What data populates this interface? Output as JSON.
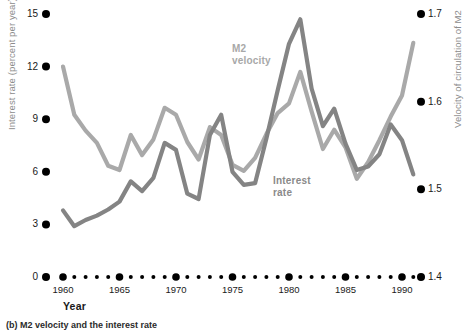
{
  "figure": {
    "caption": "(b) M2 velocity and the interest rate",
    "x_axis_title": "Year",
    "left_axis_title": "Interest rate (percent per year)",
    "right_axis_title": "Velocity of circulation of M2"
  },
  "colors": {
    "m2_velocity_line": "#a9a9a9",
    "interest_rate_line": "#848484",
    "tick_dot": "#000000",
    "axis_text": "#1a1a1a",
    "axis_title_text": "#8c8c8c"
  },
  "series_labels": {
    "m2_velocity": "M2\nvelocity",
    "m2_velocity_line1": "M2",
    "m2_velocity_line2": "velocity",
    "interest_rate_line1": "Interest",
    "interest_rate_line2": "rate"
  },
  "chart_data": {
    "type": "line",
    "title": "",
    "subtitle": "",
    "xlabel": "Year",
    "ylabel": "Interest rate (percent per year)",
    "y2label": "Velocity of circulation of M2",
    "grid": false,
    "legend_position": "inline-annotation",
    "xlim": [
      1960,
      1991
    ],
    "ylim": [
      0,
      15
    ],
    "y2lim": [
      1.4,
      1.7
    ],
    "yticks": [
      0,
      3,
      6,
      9,
      12,
      15
    ],
    "ytick_labels": [
      "0",
      "3",
      "6",
      "9",
      "12",
      "15"
    ],
    "y2ticks": [
      1.4,
      1.5,
      1.6,
      1.7
    ],
    "y2tick_labels": [
      "1.4",
      "1.5",
      "1.6",
      "1.7"
    ],
    "xticks": [
      1960,
      1965,
      1970,
      1975,
      1980,
      1985,
      1990
    ],
    "xtick_labels": [
      "1960",
      "1965",
      "1970",
      "1975",
      "1980",
      "1985",
      "1990"
    ],
    "x_minor_ticks": [
      1961,
      1962,
      1963,
      1964,
      1966,
      1967,
      1968,
      1969,
      1971,
      1972,
      1973,
      1974,
      1976,
      1977,
      1978,
      1979,
      1981,
      1982,
      1983,
      1984,
      1986,
      1987,
      1988,
      1989,
      1991
    ],
    "x": [
      1960,
      1961,
      1962,
      1963,
      1964,
      1965,
      1966,
      1967,
      1968,
      1969,
      1970,
      1971,
      1972,
      1973,
      1974,
      1975,
      1976,
      1977,
      1978,
      1979,
      1980,
      1981,
      1982,
      1983,
      1984,
      1985,
      1986,
      1987,
      1988,
      1989,
      1990,
      1991
    ],
    "series": [
      {
        "name": "M2 velocity",
        "axis": "right",
        "units": "velocity of circulation of M2",
        "color": "#a9a9a9",
        "values_right_axis": [
          1.64,
          1.585,
          1.567,
          1.553,
          1.527,
          1.522,
          1.562,
          1.539,
          1.557,
          1.593,
          1.585,
          1.554,
          1.534,
          1.571,
          1.562,
          1.528,
          1.521,
          1.536,
          1.563,
          1.587,
          1.598,
          1.634,
          1.589,
          1.546,
          1.568,
          1.548,
          1.512,
          1.531,
          1.556,
          1.583,
          1.607,
          1.667
        ],
        "values_left_axis_equivalent": [
          12.0,
          9.25,
          8.35,
          7.65,
          6.35,
          6.1,
          8.1,
          6.95,
          7.85,
          9.65,
          9.25,
          7.7,
          6.7,
          8.55,
          8.1,
          6.4,
          6.05,
          6.8,
          8.15,
          9.35,
          9.9,
          11.7,
          9.45,
          7.3,
          8.4,
          7.4,
          5.6,
          6.55,
          7.8,
          9.15,
          10.35,
          13.35
        ]
      },
      {
        "name": "Interest rate",
        "axis": "left",
        "units": "percent per year",
        "color": "#848484",
        "values": [
          3.8,
          2.9,
          3.25,
          3.5,
          3.85,
          4.3,
          5.45,
          4.9,
          5.65,
          7.65,
          7.25,
          4.75,
          4.45,
          8.1,
          9.25,
          6.0,
          5.25,
          5.35,
          7.9,
          10.65,
          13.3,
          14.7,
          10.75,
          8.6,
          9.6,
          7.6,
          6.1,
          6.3,
          7.0,
          8.7,
          7.8,
          5.85
        ]
      }
    ],
    "annotations": [
      {
        "text": "M2 velocity",
        "x": 1978,
        "series": "M2 velocity"
      },
      {
        "text": "Interest rate",
        "x": 1982,
        "series": "Interest rate"
      }
    ]
  }
}
